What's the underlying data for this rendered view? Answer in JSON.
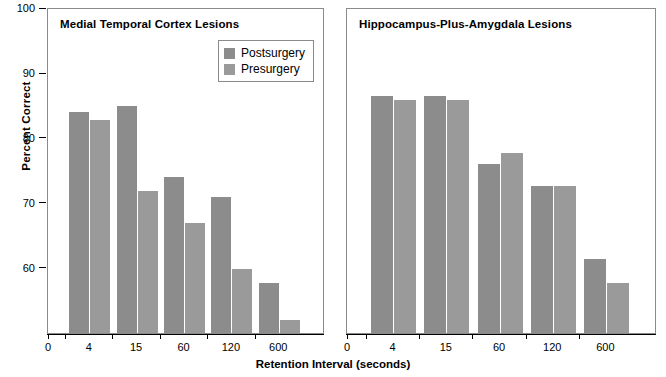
{
  "chart_data": {
    "type": "bar",
    "title": "",
    "xlabel": "Retention Interval (seconds)",
    "ylabel": "Percent Correct",
    "categories": [
      "4",
      "15",
      "60",
      "120",
      "600"
    ],
    "origin_label": "0",
    "ylim": [
      49.8,
      100
    ],
    "yticks": [
      60,
      70,
      80,
      90,
      100
    ],
    "ytick_labels": [
      "60",
      "70",
      "80",
      "90",
      "100"
    ],
    "grid": false,
    "legend_position": "upper-right-of-left-panel",
    "legend": [
      {
        "name": "Postsurgery",
        "color": "#8c8c8c"
      },
      {
        "name": "Presurgery",
        "color": "#9a9a9a"
      }
    ],
    "panels": [
      {
        "title": "Medial Temporal Cortex Lesions",
        "series": [
          {
            "name": "Postsurgery",
            "values": [
              85.0,
              86.0,
              75.0,
              72.0,
              58.8
            ]
          },
          {
            "name": "Presurgery",
            "values": [
              83.9,
              72.9,
              67.9,
              60.9,
              53.1
            ]
          }
        ]
      },
      {
        "title": "Hippocampus-Plus-Amygdala Lesions",
        "series": [
          {
            "name": "Postsurgery",
            "values": [
              87.6,
              87.6,
              77.0,
              73.6,
              62.5
            ]
          },
          {
            "name": "Presurgery",
            "values": [
              86.9,
              86.9,
              78.7,
              73.6,
              58.7
            ]
          }
        ]
      }
    ]
  },
  "colors": {
    "postsurgery": "#8c8c8c",
    "presurgery": "#9a9a9a",
    "axis": "#000000",
    "panel_border": "#8a8a8a",
    "background": "#ffffff"
  }
}
